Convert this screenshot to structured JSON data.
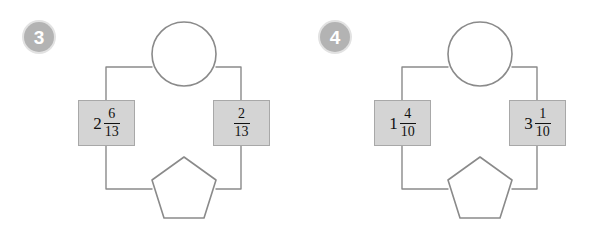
{
  "page": {
    "background_color": "#ffffff",
    "panel_count": 2
  },
  "style": {
    "badge_fill": "#b3b3b3",
    "badge_ring": "#e2e2e2",
    "badge_text_color": "#ffffff",
    "box_fill": "#d4d4d4",
    "box_border": "#a8a8a8",
    "line_color": "#8a8a8a",
    "shape_stroke": "#8a8a8a",
    "text_color": "#111111"
  },
  "panels": [
    {
      "number": "3",
      "badge_name": "problem-number-3",
      "shapes": {
        "top": {
          "type": "circle",
          "label": "",
          "filled": false
        },
        "bottom": {
          "type": "pentagon",
          "label": "",
          "filled": false
        }
      },
      "boxes": [
        {
          "position": "left",
          "whole": "2",
          "numerator": "6",
          "denominator": "13",
          "text": "2 6/13"
        },
        {
          "position": "right",
          "whole": "",
          "numerator": "2",
          "denominator": "13",
          "text": "2/13"
        }
      ]
    },
    {
      "number": "4",
      "badge_name": "problem-number-4",
      "shapes": {
        "top": {
          "type": "circle",
          "label": "",
          "filled": false
        },
        "bottom": {
          "type": "pentagon",
          "label": "",
          "filled": false
        }
      },
      "boxes": [
        {
          "position": "left",
          "whole": "1",
          "numerator": "4",
          "denominator": "10",
          "text": "1 4/10"
        },
        {
          "position": "right",
          "whole": "3",
          "numerator": "1",
          "denominator": "10",
          "text": "3 1/10"
        }
      ]
    }
  ]
}
